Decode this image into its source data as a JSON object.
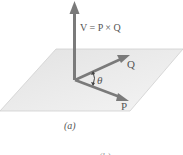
{
  "figure": {
    "vector_label": "V = P × Q",
    "q_label": "Q",
    "p_label": "P",
    "angle_label": "θ",
    "caption": "(a)",
    "cropped_next_caption": "(b)"
  },
  "colors": {
    "arrow": "#7a7a7a",
    "plane_fill": "#e6e6e6",
    "plane_stroke": "#c8c8c8",
    "text": "#555555"
  }
}
